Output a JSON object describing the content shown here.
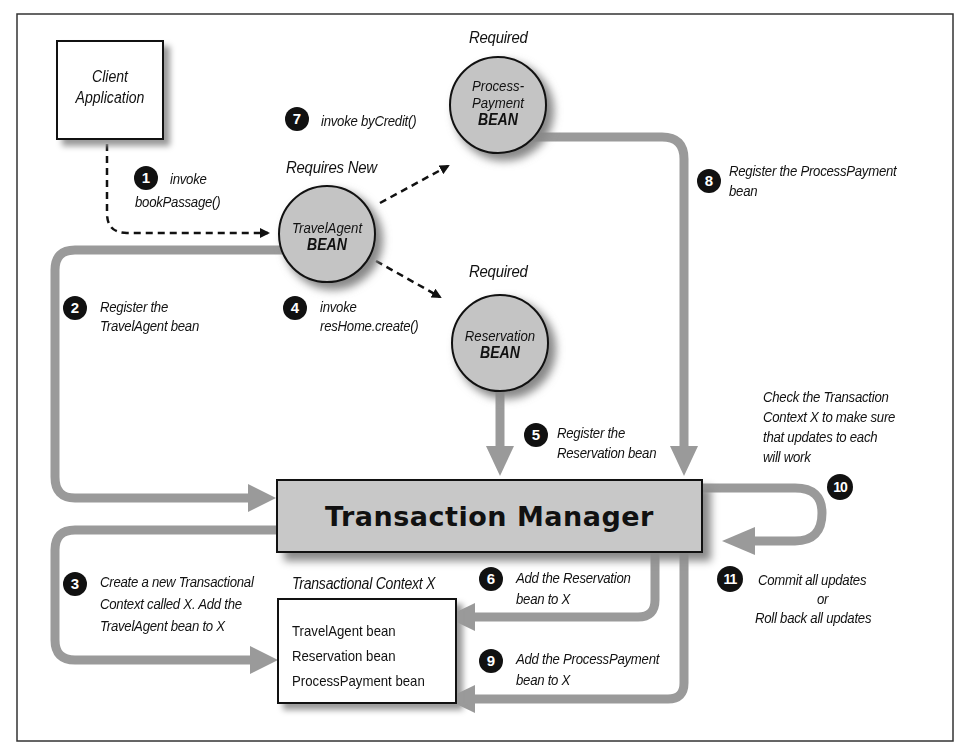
{
  "diagram": {
    "client": {
      "line1": "Client",
      "line2": "Application"
    },
    "beans": {
      "travel_agent": {
        "attribute": "Requires New",
        "name": "TravelAgent",
        "type": "BEAN"
      },
      "process_payment": {
        "attribute": "Required",
        "name_line1": "Process-",
        "name_line2": "Payment",
        "type": "BEAN"
      },
      "reservation": {
        "attribute": "Required",
        "name": "Reservation",
        "type": "BEAN"
      }
    },
    "transaction_manager": "Transaction Manager",
    "context": {
      "title": "Transactional Context X",
      "items": [
        "TravelAgent bean",
        "Reservation bean",
        "ProcessPayment bean"
      ]
    },
    "steps": [
      {
        "num": "1",
        "line1": "invoke",
        "line2": "bookPassage()"
      },
      {
        "num": "2",
        "line1": "Register the",
        "line2": "TravelAgent bean"
      },
      {
        "num": "3",
        "line1": "Create a new Transactional",
        "line2": "Context called X. Add the",
        "line3": "TravelAgent bean to X"
      },
      {
        "num": "4",
        "line1": "invoke",
        "line2": "resHome.create()"
      },
      {
        "num": "5",
        "line1": "Register the",
        "line2": "Reservation bean"
      },
      {
        "num": "6",
        "line1": "Add the Reservation",
        "line2": "bean to X"
      },
      {
        "num": "7",
        "line1": "invoke byCredit()"
      },
      {
        "num": "8",
        "line1": "Register the ProcessPayment",
        "line2": "bean"
      },
      {
        "num": "9",
        "line1": "Add the ProcessPayment",
        "line2": "bean to X"
      },
      {
        "num": "10",
        "line1": "Check the Transaction",
        "line2": "Context X to make sure",
        "line3": "that updates to each",
        "line4": "will work"
      },
      {
        "num": "11",
        "line1": "Commit all updates",
        "line2": "or",
        "line3": "Roll back all updates"
      }
    ],
    "colors": {
      "arrow": "#9a9a9a",
      "bean_fill": "#c4c4c4",
      "tm_fill": "#c8c8c8",
      "ink": "#111111"
    }
  }
}
